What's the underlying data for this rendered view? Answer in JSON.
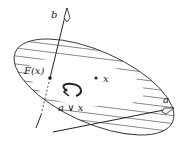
{
  "diagram": {
    "labels": {
      "b": "b",
      "a": "a",
      "fx": "F(x)",
      "x": "x",
      "avx": "a ∨ x"
    },
    "colors": {
      "stroke": "#222222",
      "hatch": "#555555",
      "background": "#ffffff"
    }
  }
}
